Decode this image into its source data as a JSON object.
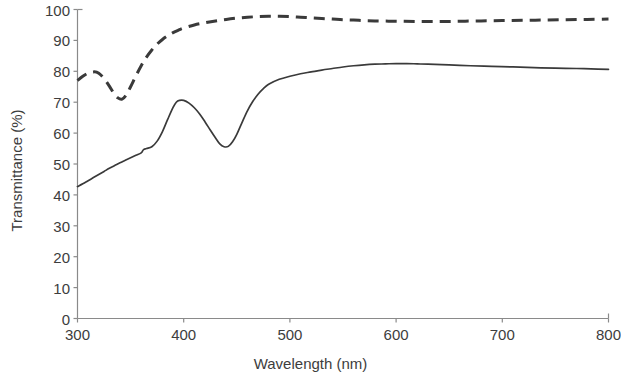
{
  "chart_data": {
    "type": "line",
    "title": "",
    "subtitle": "",
    "xlabel": "Wavelength (nm)",
    "ylabel": "Transmittance (%)",
    "xlim": [
      300,
      800
    ],
    "ylim": [
      0,
      100
    ],
    "xticks": [
      300,
      400,
      500,
      600,
      700,
      800
    ],
    "yticks": [
      0,
      10,
      20,
      30,
      40,
      50,
      60,
      70,
      80,
      90,
      100
    ],
    "grid": false,
    "legend": "none",
    "axis_color": "#8a8a8a",
    "line_color": "#3a3a3a",
    "series": [
      {
        "name": "solid-curve",
        "style": "solid",
        "color": "#3a3a3a",
        "x": [
          300,
          305,
          310,
          315,
          320,
          325,
          330,
          335,
          340,
          345,
          350,
          355,
          360,
          362,
          365,
          370,
          375,
          380,
          385,
          390,
          393,
          396,
          400,
          405,
          410,
          415,
          420,
          425,
          430,
          434,
          438,
          442,
          446,
          450,
          455,
          460,
          465,
          470,
          475,
          480,
          490,
          500,
          510,
          520,
          530,
          540,
          550,
          560,
          570,
          580,
          590,
          600,
          610,
          620,
          630,
          650,
          670,
          690,
          710,
          730,
          750,
          770,
          790,
          800
        ],
        "y": [
          42.7,
          43.6,
          44.6,
          45.6,
          46.6,
          47.6,
          48.6,
          49.5,
          50.4,
          51.2,
          52.0,
          52.8,
          53.6,
          54.6,
          55.0,
          55.6,
          57.4,
          60.5,
          64.5,
          68.3,
          70.0,
          70.6,
          70.6,
          69.7,
          68.2,
          66.2,
          63.7,
          61.0,
          58.4,
          56.5,
          55.6,
          55.7,
          57.2,
          59.6,
          63.5,
          67.2,
          70.2,
          72.6,
          74.4,
          75.8,
          77.4,
          78.4,
          79.2,
          79.8,
          80.4,
          80.9,
          81.4,
          81.8,
          82.1,
          82.3,
          82.4,
          82.5,
          82.5,
          82.4,
          82.3,
          82.1,
          81.8,
          81.6,
          81.4,
          81.2,
          81.0,
          80.9,
          80.7,
          80.6
        ]
      },
      {
        "name": "dashed-curve",
        "style": "dashed",
        "color": "#3a3a3a",
        "x": [
          300,
          305,
          310,
          315,
          318,
          322,
          326,
          330,
          334,
          338,
          342,
          346,
          350,
          355,
          360,
          365,
          370,
          375,
          380,
          385,
          390,
          395,
          400,
          410,
          420,
          430,
          440,
          450,
          460,
          470,
          480,
          490,
          500,
          510,
          520,
          530,
          540,
          550,
          560,
          570,
          580,
          600,
          620,
          640,
          660,
          680,
          700,
          720,
          740,
          760,
          780,
          800
        ],
        "y": [
          77.0,
          78.4,
          79.4,
          79.8,
          79.7,
          78.8,
          77.2,
          75.2,
          73.0,
          71.4,
          71.0,
          72.4,
          75.0,
          78.5,
          81.8,
          84.6,
          86.9,
          88.8,
          90.3,
          91.5,
          92.5,
          93.3,
          94.0,
          95.0,
          95.7,
          96.3,
          96.8,
          97.2,
          97.5,
          97.7,
          97.8,
          97.8,
          97.7,
          97.5,
          97.3,
          97.1,
          96.9,
          96.7,
          96.6,
          96.4,
          96.3,
          96.2,
          96.1,
          96.1,
          96.2,
          96.3,
          96.4,
          96.5,
          96.6,
          96.7,
          96.8,
          96.9
        ]
      }
    ]
  },
  "axes": {
    "x_tick_labels": [
      "300",
      "400",
      "500",
      "600",
      "700",
      "800"
    ],
    "y_tick_labels": [
      "0",
      "10",
      "20",
      "30",
      "40",
      "50",
      "60",
      "70",
      "80",
      "90",
      "100"
    ],
    "x_title": "Wavelength (nm)",
    "y_title": "Transmittance (%)"
  }
}
